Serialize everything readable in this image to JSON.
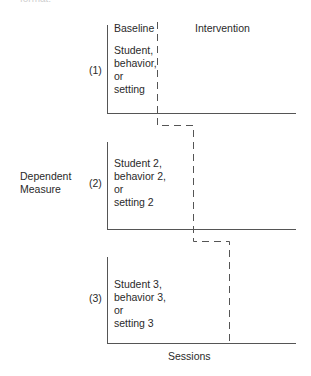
{
  "header_fragment": "format:",
  "phase_labels": {
    "baseline": "Baseline",
    "intervention": "Intervention"
  },
  "y_axis_label": [
    "Dependent",
    "Measure"
  ],
  "x_axis_label": "Sessions",
  "panels": [
    {
      "number": "(1)",
      "lines": [
        "Student,",
        "behavior,",
        "or",
        "setting"
      ]
    },
    {
      "number": "(2)",
      "lines": [
        "Student 2,",
        "behavior 2,",
        "or",
        "setting 2"
      ]
    },
    {
      "number": "(3)",
      "lines": [
        "Student 3,",
        "behavior 3,",
        "or",
        "setting 3"
      ]
    }
  ],
  "colors": {
    "ink": "#2a2a2a",
    "axis": "#555555"
  }
}
